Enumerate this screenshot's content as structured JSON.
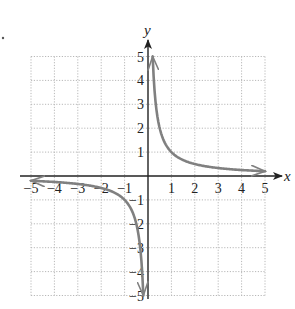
{
  "chart_data": {
    "type": "line",
    "title": "",
    "function": "y = 1/x",
    "xlabel": "x",
    "ylabel": "y",
    "xlim": [
      -5,
      5
    ],
    "ylim": [
      -5,
      5
    ],
    "grid": true,
    "grid_style": "dotted",
    "x_ticks": [
      -5,
      -4,
      -3,
      -2,
      -1,
      1,
      2,
      3,
      4,
      5
    ],
    "y_ticks": [
      -5,
      -4,
      -3,
      -2,
      -1,
      1,
      2,
      3,
      4,
      5
    ],
    "x_tick_labels": [
      "−5",
      "−4",
      "−3",
      "−2",
      "−1",
      "1",
      "2",
      "3",
      "4",
      "5"
    ],
    "y_tick_labels": [
      "−5",
      "−4",
      "−3",
      "−2",
      "−1",
      "1",
      "2",
      "3",
      "4",
      "5"
    ],
    "series": [
      {
        "name": "branch-positive",
        "x": [
          0.2,
          0.25,
          0.33,
          0.5,
          0.75,
          1,
          1.5,
          2,
          3,
          4,
          5
        ],
        "y": [
          5,
          4,
          3,
          2,
          1.33,
          1,
          0.67,
          0.5,
          0.33,
          0.25,
          0.2
        ],
        "color": "#808080",
        "arrows_at_ends": true
      },
      {
        "name": "branch-negative",
        "x": [
          -5,
          -4,
          -3,
          -2,
          -1.5,
          -1,
          -0.75,
          -0.5,
          -0.33,
          -0.25,
          -0.2
        ],
        "y": [
          -0.2,
          -0.25,
          -0.33,
          -0.5,
          -0.67,
          -1,
          -1.33,
          -2,
          -3,
          -4,
          -5
        ],
        "color": "#808080",
        "arrows_at_ends": true
      }
    ]
  },
  "colors": {
    "curve": "#808080",
    "axis": "#222222",
    "grid": "#b8b8b8"
  }
}
